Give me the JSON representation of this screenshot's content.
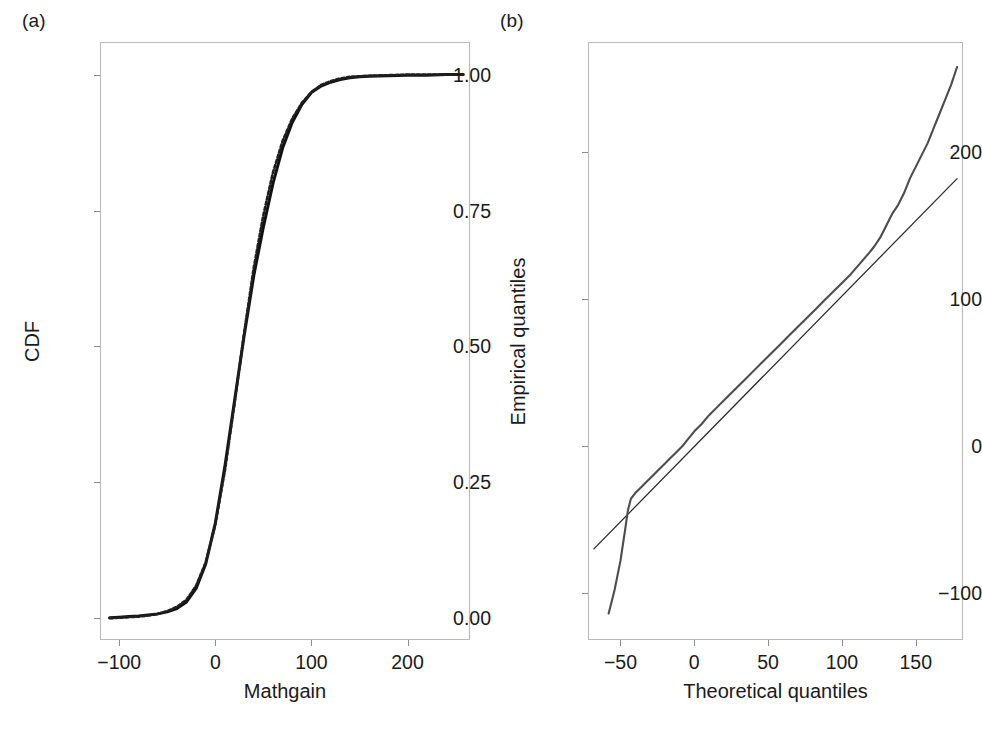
{
  "figure": {
    "panel_a_label": "(a)",
    "panel_b_label": "(b)"
  },
  "chart_data": [
    {
      "type": "line",
      "panel": "(a)",
      "title": "",
      "xlabel": "Mathgain",
      "ylabel": "CDF",
      "xlim": [
        -120,
        265
      ],
      "ylim": [
        -0.04,
        1.06
      ],
      "xticks": [
        -100,
        0,
        100,
        200
      ],
      "xticklabels": [
        "−100",
        "0",
        "100",
        "200"
      ],
      "yticks": [
        0.0,
        0.25,
        0.5,
        0.75,
        1.0
      ],
      "yticklabels": [
        "0.00",
        "0.25",
        "0.50",
        "0.75",
        "1.00"
      ],
      "grid": false,
      "legend": "none",
      "series": [
        {
          "name": "Empirical CDF",
          "style": "solid",
          "x": [
            -110,
            -100,
            -90,
            -80,
            -70,
            -60,
            -50,
            -40,
            -30,
            -20,
            -10,
            0,
            10,
            20,
            30,
            40,
            50,
            60,
            70,
            80,
            90,
            100,
            110,
            120,
            130,
            140,
            150,
            160,
            180,
            200,
            220,
            240,
            258
          ],
          "y": [
            0.001,
            0.002,
            0.003,
            0.004,
            0.006,
            0.008,
            0.012,
            0.018,
            0.03,
            0.055,
            0.1,
            0.175,
            0.28,
            0.4,
            0.52,
            0.63,
            0.72,
            0.8,
            0.865,
            0.912,
            0.945,
            0.967,
            0.979,
            0.986,
            0.991,
            0.994,
            0.996,
            0.997,
            0.998,
            0.999,
            0.999,
            1.0,
            1.0
          ]
        },
        {
          "name": "Fitted normal CDF",
          "style": "dashed",
          "x": [
            -110,
            -100,
            -90,
            -80,
            -70,
            -60,
            -50,
            -40,
            -30,
            -20,
            -10,
            0,
            10,
            20,
            30,
            40,
            50,
            60,
            70,
            80,
            90,
            100,
            110,
            120,
            130,
            140,
            150,
            160,
            180,
            200,
            220,
            240,
            258
          ],
          "y": [
            0.0,
            0.001,
            0.002,
            0.003,
            0.005,
            0.008,
            0.013,
            0.021,
            0.034,
            0.06,
            0.103,
            0.172,
            0.272,
            0.395,
            0.525,
            0.645,
            0.742,
            0.82,
            0.878,
            0.919,
            0.948,
            0.968,
            0.981,
            0.988,
            0.993,
            0.996,
            0.997,
            0.998,
            0.999,
            1.0,
            1.0,
            1.0,
            1.0
          ]
        }
      ]
    },
    {
      "type": "line",
      "panel": "(b)",
      "title": "",
      "xlabel": "Theoretical quantiles",
      "ylabel": "Empirical quantiles",
      "xlim": [
        -72,
        182
      ],
      "ylim": [
        -132,
        275
      ],
      "xticks": [
        -50,
        0,
        50,
        100,
        150
      ],
      "xticklabels": [
        "−50",
        "0",
        "50",
        "100",
        "150"
      ],
      "yticks": [
        -100,
        0,
        100,
        200
      ],
      "yticklabels": [
        "−100",
        "0",
        "100",
        "200"
      ],
      "grid": false,
      "legend": "none",
      "series": [
        {
          "name": "Reference line",
          "style": "solid-thin",
          "x": [
            -68,
            178
          ],
          "y": [
            -70,
            182
          ]
        },
        {
          "name": "Q-Q sample quantiles",
          "style": "solid",
          "x": [
            -58,
            -54,
            -50,
            -47,
            -45,
            -43,
            -40,
            -36,
            -32,
            -28,
            -24,
            -20,
            -16,
            -12,
            -8,
            -4,
            0,
            5,
            10,
            16,
            22,
            28,
            34,
            40,
            46,
            52,
            58,
            64,
            70,
            76,
            82,
            88,
            94,
            100,
            106,
            112,
            118,
            122,
            126,
            130,
            134,
            138,
            142,
            146,
            150,
            154,
            158,
            162,
            166,
            170,
            174,
            178
          ],
          "y": [
            -114,
            -98,
            -78,
            -58,
            -44,
            -36,
            -32,
            -28,
            -24,
            -20,
            -16,
            -12,
            -8,
            -4,
            0,
            5,
            10,
            15,
            21,
            27,
            33,
            39,
            45,
            51,
            57,
            63,
            69,
            75,
            81,
            87,
            93,
            99,
            105,
            111,
            117,
            124,
            131,
            136,
            142,
            150,
            158,
            164,
            172,
            182,
            190,
            198,
            206,
            216,
            226,
            236,
            246,
            258
          ]
        }
      ]
    }
  ]
}
